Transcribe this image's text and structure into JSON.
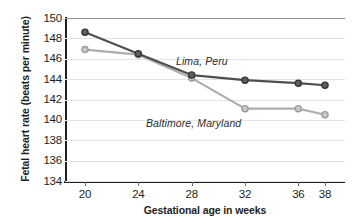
{
  "chart_data": {
    "type": "line",
    "title": "",
    "xlabel": "Gestational age in weeks",
    "ylabel": "Fetal heart rate (beats per minute)",
    "x": [
      20,
      24,
      28,
      32,
      36,
      38
    ],
    "xticklabels": [
      "20",
      "24",
      "28",
      "32",
      "36",
      "38"
    ],
    "yticks": [
      134,
      136,
      138,
      140,
      142,
      144,
      146,
      148,
      150
    ],
    "yticklabels": [
      "134",
      "136",
      "138",
      "140",
      "142",
      "144",
      "146",
      "148",
      "150"
    ],
    "xlim": [
      18.5,
      39.5
    ],
    "ylim": [
      134,
      150
    ],
    "grid": true,
    "legend_position": "inline-annotations",
    "series": [
      {
        "name": "Lima, Peru",
        "color": "#4f4f4f",
        "marker": "circle",
        "values": [
          148.6,
          146.5,
          144.4,
          143.9,
          143.6,
          143.4
        ]
      },
      {
        "name": "Baltimore, Maryland",
        "color": "#adadad",
        "marker": "circle",
        "values": [
          146.9,
          146.4,
          144.1,
          141.1,
          141.1,
          140.5
        ]
      }
    ],
    "annotations": [
      {
        "text": "Lima, Peru",
        "series": "Lima, Peru"
      },
      {
        "text": "Baltimore, Maryland",
        "series": "Baltimore, Maryland"
      }
    ]
  },
  "colors": {
    "axis": "#231f20",
    "gridline": "#e3e3e3",
    "top_rule": "#8d8d8d",
    "background": "#ffffff",
    "lima": "#4f4f4f",
    "baltimore": "#adadad"
  }
}
